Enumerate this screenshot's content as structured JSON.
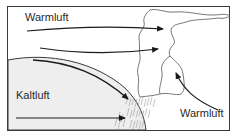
{
  "diagram": {
    "type": "warm-front-occlusion",
    "labels": {
      "warm_air_top": "Warmluft",
      "cold_air": "Kaltluft",
      "warm_air_right": "Warmluft"
    },
    "colors": {
      "frame": "#3a3a3a",
      "cold_air_fill": "#eeeeee",
      "arrow": "#1a1a1a",
      "cloud_outline": "#555555",
      "rain": "#9a9a9a",
      "text": "#2a2a2a"
    },
    "elements": [
      {
        "id": "frame",
        "kind": "border"
      },
      {
        "id": "cold-air-dome",
        "kind": "region",
        "label_ref": "cold_air"
      },
      {
        "id": "warm-air-arrow-1",
        "kind": "arrow",
        "direction": "right",
        "into": "cloud"
      },
      {
        "id": "warm-air-arrow-2",
        "kind": "arrow",
        "direction": "right",
        "into": "cloud"
      },
      {
        "id": "frontal-arrow",
        "kind": "arrow",
        "direction": "down-right",
        "along": "cold-air-boundary"
      },
      {
        "id": "cold-air-arrow",
        "kind": "arrow",
        "direction": "right"
      },
      {
        "id": "warm-air-rising-arrow",
        "kind": "arrow",
        "direction": "up-left",
        "label_ref": "warm_air_right"
      },
      {
        "id": "cloud",
        "kind": "cloud-outline"
      },
      {
        "id": "precipitation",
        "kind": "rain-hatching"
      }
    ]
  }
}
